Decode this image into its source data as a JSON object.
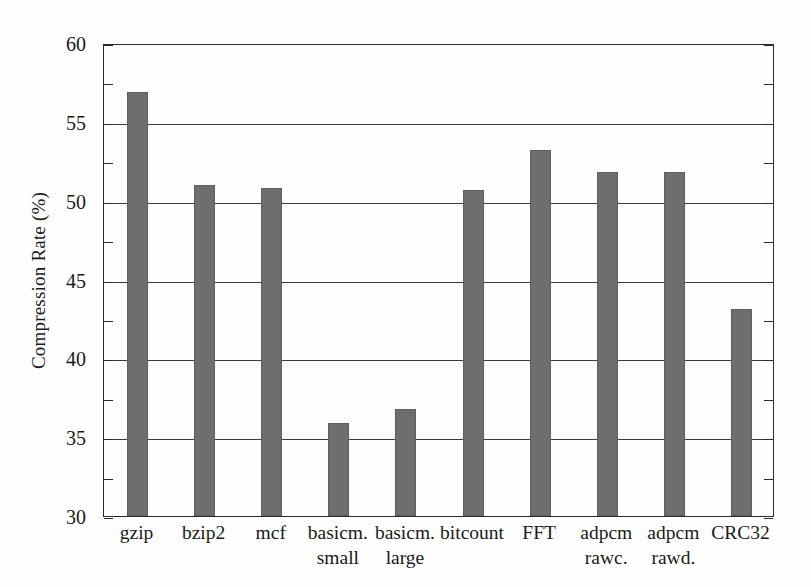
{
  "chart_data": {
    "type": "bar",
    "title": "",
    "xlabel": "",
    "ylabel": "Compression Rate (%)",
    "ylim": [
      30,
      60
    ],
    "ytick_values": [
      30,
      35,
      40,
      45,
      50,
      55,
      60
    ],
    "ytick_labels": [
      "30",
      "35",
      "40",
      "45",
      "50",
      "55",
      "60"
    ],
    "ytick_minor_values": [
      32.5,
      37.5,
      42.5,
      47.5,
      52.5,
      57.5
    ],
    "grid": "horizontal",
    "legend": "none",
    "bar_color": "#6e6e6e",
    "axis_color": "#2a2a2a",
    "background_color": "#fefefe",
    "categories": [
      "gzip",
      "bzip2",
      "mcf",
      "basicm. small",
      "basicm. large",
      "bitcount",
      "FFT",
      "adpcm rawc.",
      "adpcm rawd.",
      "CRC32"
    ],
    "category_lines": [
      [
        "gzip",
        ""
      ],
      [
        "bzip2",
        ""
      ],
      [
        "mcf",
        ""
      ],
      [
        "basicm.",
        "small"
      ],
      [
        "basicm.",
        "large"
      ],
      [
        "bitcount",
        ""
      ],
      [
        "FFT",
        ""
      ],
      [
        "adpcm",
        "rawc."
      ],
      [
        "adpcm",
        "rawd."
      ],
      [
        "CRC32",
        ""
      ]
    ],
    "values": [
      56.9,
      51.0,
      50.8,
      35.9,
      36.8,
      50.7,
      53.2,
      51.8,
      51.8,
      43.1
    ]
  }
}
